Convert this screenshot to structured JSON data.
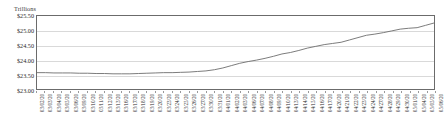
{
  "chart_data": {
    "type": "line",
    "title": "",
    "subtitle": "",
    "unit_label": "Trillions",
    "xlabel": "",
    "ylabel": "",
    "ylim": [
      23.0,
      25.5
    ],
    "yticks": [
      23.0,
      23.5,
      24.0,
      24.5,
      25.0,
      25.5
    ],
    "ytick_labels": [
      "$23.00",
      "$23.50",
      "$24.00",
      "$24.50",
      "$25.00",
      "$25.50"
    ],
    "grid": true,
    "legend": "none",
    "series_color": "#6b6b6b",
    "series": [
      {
        "name": "Money Supply",
        "categories": [
          "03/02/20",
          "03/03/20",
          "03/04/20",
          "03/05/20",
          "03/06/20",
          "03/09/20",
          "03/10/20",
          "03/11/20",
          "03/12/20",
          "03/13/20",
          "03/16/20",
          "03/17/20",
          "03/18/20",
          "03/19/20",
          "03/20/20",
          "03/23/20",
          "03/24/20",
          "03/25/20",
          "03/26/20",
          "03/27/20",
          "03/30/20",
          "03/31/20",
          "04/01/20",
          "04/02/20",
          "04/03/20",
          "04/06/20",
          "04/07/20",
          "04/08/20",
          "04/09/20",
          "04/10/20",
          "04/13/20",
          "04/14/20",
          "04/15/20",
          "04/16/20",
          "04/17/20",
          "04/20/20",
          "04/21/20",
          "04/22/20",
          "04/23/20",
          "04/24/20",
          "04/27/20",
          "04/28/20",
          "04/29/20",
          "04/30/20",
          "05/01/20",
          "05/04/20",
          "05/05/20",
          "05/06/20"
        ],
        "values": [
          23.56,
          23.56,
          23.55,
          23.55,
          23.55,
          23.54,
          23.54,
          23.53,
          23.53,
          23.52,
          23.52,
          23.52,
          23.53,
          23.54,
          23.55,
          23.56,
          23.56,
          23.57,
          23.58,
          23.6,
          23.62,
          23.66,
          23.72,
          23.8,
          23.88,
          23.94,
          23.99,
          24.05,
          24.12,
          24.2,
          24.25,
          24.32,
          24.4,
          24.46,
          24.52,
          24.56,
          24.6,
          24.68,
          24.76,
          24.84,
          24.88,
          24.93,
          24.99,
          25.05,
          25.08,
          25.1,
          25.18,
          25.26
        ]
      }
    ]
  }
}
